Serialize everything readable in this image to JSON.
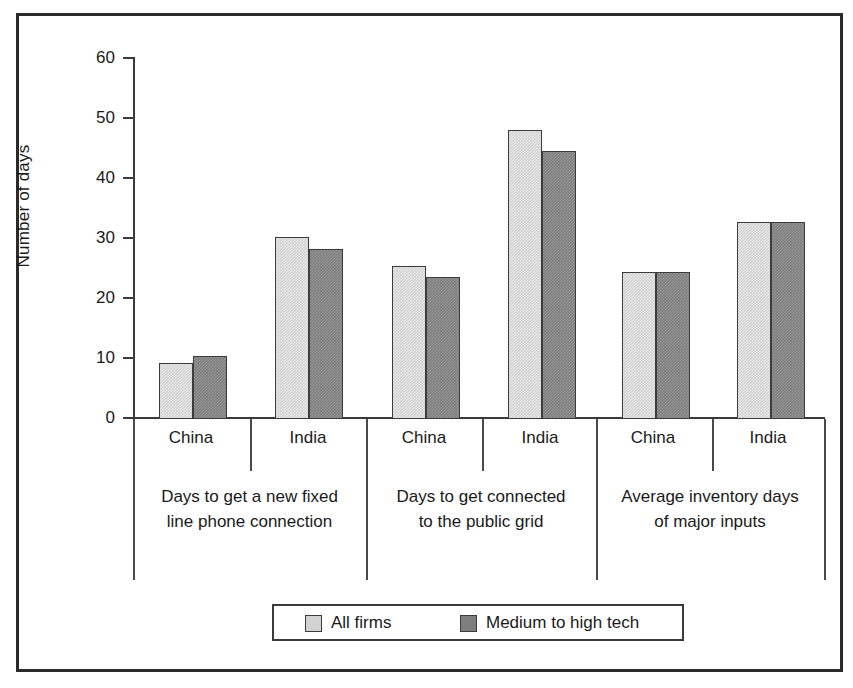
{
  "chart_data": {
    "type": "bar",
    "title": "",
    "xlabel": "",
    "ylabel": "Number of days",
    "ylim": [
      0,
      60
    ],
    "yticks": [
      0,
      10,
      20,
      30,
      40,
      50,
      60
    ],
    "grid": false,
    "legend_position": "bottom",
    "groups": [
      {
        "label_line1": "Days to get a new fixed",
        "label_line2": "line phone connection",
        "categories": [
          "China",
          "India"
        ]
      },
      {
        "label_line1": "Days to get connected",
        "label_line2": "to the public grid",
        "categories": [
          "China",
          "India"
        ]
      },
      {
        "label_line1": "Average inventory days",
        "label_line2": "of major inputs",
        "categories": [
          "China",
          "India"
        ]
      }
    ],
    "categories": [
      "Days to get a new fixed line phone connection - China",
      "Days to get a new fixed line phone connection - India",
      "Days to get connected to the public grid - China",
      "Days to get connected to the public grid - India",
      "Average inventory days of major inputs - China",
      "Average inventory days of major inputs - India"
    ],
    "series": [
      {
        "name": "All firms",
        "color": "#d2d2d2",
        "values": [
          9.3,
          30.1,
          25.3,
          47.9,
          24.4,
          32.7
        ]
      },
      {
        "name": "Medium to high tech",
        "color": "#7e7e7e",
        "values": [
          10.5,
          28.1,
          23.5,
          44.5,
          24.4,
          32.7
        ]
      }
    ]
  },
  "axis": {
    "tick_labels": [
      "60",
      "50",
      "40",
      "30",
      "20",
      "10",
      "0"
    ],
    "y_title": "Number of days"
  },
  "legend": {
    "items": [
      {
        "label": "All firms",
        "color": "#d2d2d2"
      },
      {
        "label": "Medium to high tech",
        "color": "#7e7e7e"
      }
    ]
  }
}
